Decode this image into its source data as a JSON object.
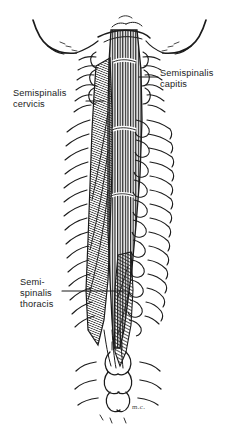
{
  "figure": {
    "background_color": "#ffffff",
    "ink_color": "#1b1b1b",
    "labels": {
      "cervicis": "Semispinalis\ncervicis",
      "capitis": "Semispinalis\ncapitis",
      "thoracis": "Semi-\nspinalis\nthoracis"
    },
    "signature": "m.c."
  }
}
